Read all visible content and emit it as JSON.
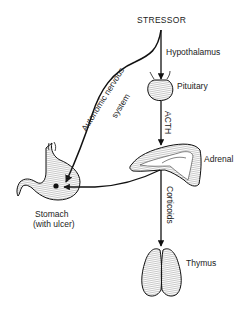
{
  "diagram": {
    "type": "physiological-pathway",
    "title": "STRESSOR",
    "nodes": [
      {
        "id": "stressor",
        "label": "STRESSOR"
      },
      {
        "id": "hypothalamus",
        "label": "Hypothalamus"
      },
      {
        "id": "pituitary",
        "label": "Pituitary"
      },
      {
        "id": "adrenal",
        "label": "Adrenal"
      },
      {
        "id": "thymus",
        "label": "Thymus"
      },
      {
        "id": "stomach",
        "label_line1": "Stomach",
        "label_line2": "(with ulcer)"
      }
    ],
    "edges": [
      {
        "from": "stressor",
        "to": "pituitary",
        "via": "Hypothalamus"
      },
      {
        "from": "pituitary",
        "to": "adrenal",
        "label": "ACTH"
      },
      {
        "from": "adrenal",
        "to": "thymus",
        "label": "Corticoids"
      },
      {
        "from": "adrenal",
        "to": "stomach",
        "label": ""
      },
      {
        "from": "stressor",
        "to": "stomach",
        "label_line1": "Autonomic nervous",
        "label_line2": "system"
      }
    ],
    "colors": {
      "line": "#111111",
      "background": "#ffffff"
    }
  },
  "labels": {
    "stressor": "STRESSOR",
    "hypothalamus": "Hypothalamus",
    "pituitary": "Pituitary",
    "acth": "ACTH",
    "adrenal": "Adrenal",
    "corticoids": "Corticoids",
    "thymus": "Thymus",
    "stomach": "Stomach",
    "stomach_note": "(with ulcer)",
    "ans_line1": "Autonomic nervous",
    "ans_line2": "system"
  }
}
